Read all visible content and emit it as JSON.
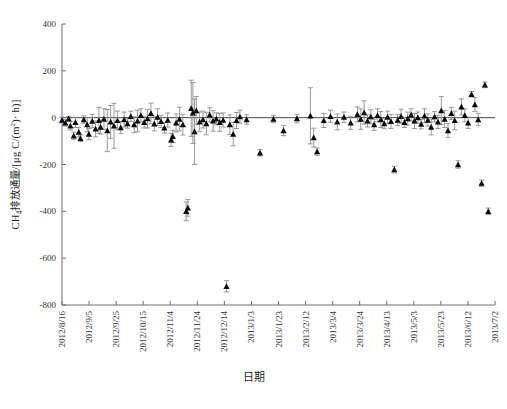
{
  "figure": {
    "background": "#ffffff",
    "marker_color": "#0b0b0b",
    "errorbar_color": "#8d8d8d",
    "axis_color": "#6f6f6f"
  },
  "axis_titles": {
    "x": "日期",
    "y_prefix": "CH",
    "y_sub": "4",
    "y_suffix": "排放通量/[μg C/(m",
    "y_sup": "2",
    "y_tail": "· h)]"
  },
  "chart_data": {
    "type": "scatter",
    "title": "",
    "subtitle": "",
    "xlabel": "日期",
    "ylabel": "CH4排放通量/[μg C/(m2 · h)]",
    "grid": false,
    "legend": null,
    "ylim": [
      -800,
      400
    ],
    "yticks": [
      400,
      200,
      0,
      -200,
      -400,
      -600,
      -800
    ],
    "ytick_labels": [
      "400",
      "200",
      "0",
      "-200",
      "-400",
      "-600",
      "-800"
    ],
    "xlim": [
      "2012/8/16",
      "2013/7/12"
    ],
    "xtick_labels": [
      "2012/8/16",
      "2012/9/5",
      "2012/9/25",
      "2012/10/15",
      "2012/11/4",
      "2012/11/24",
      "2012/12/14",
      "2013/1/3",
      "2013/1/23",
      "2013/2/12",
      "2013/3/4",
      "2013/3/24",
      "2013/4/13",
      "2013/5/3",
      "2013/5/23",
      "2013/6/12",
      "2013/7/2"
    ],
    "xtick_rotation": -90,
    "marker_shape": "triangle-up",
    "has_error_bars": true,
    "reference_line_y": 0,
    "series": [
      {
        "name": "CH4 flux",
        "points": [
          {
            "x": 0,
            "y": -10,
            "err": 12
          },
          {
            "x": 2,
            "y": -22,
            "err": 14
          },
          {
            "x": 4,
            "y": -5,
            "err": 10
          },
          {
            "x": 5,
            "y": -35,
            "err": 18
          },
          {
            "x": 7,
            "y": -78,
            "err": 16
          },
          {
            "x": 8,
            "y": -20,
            "err": 22
          },
          {
            "x": 10,
            "y": -62,
            "err": 20
          },
          {
            "x": 11,
            "y": -88,
            "err": 14
          },
          {
            "x": 13,
            "y": -8,
            "err": 16
          },
          {
            "x": 15,
            "y": -30,
            "err": 30
          },
          {
            "x": 16,
            "y": -70,
            "err": 24
          },
          {
            "x": 18,
            "y": -15,
            "err": 28
          },
          {
            "x": 20,
            "y": -48,
            "err": 34
          },
          {
            "x": 22,
            "y": -12,
            "err": 56
          },
          {
            "x": 23,
            "y": -40,
            "err": 30
          },
          {
            "x": 25,
            "y": -6,
            "err": 44
          },
          {
            "x": 27,
            "y": -55,
            "err": 90
          },
          {
            "x": 29,
            "y": -18,
            "err": 70
          },
          {
            "x": 31,
            "y": -35,
            "err": 96
          },
          {
            "x": 33,
            "y": -12,
            "err": 40
          },
          {
            "x": 35,
            "y": -42,
            "err": 26
          },
          {
            "x": 37,
            "y": -8,
            "err": 32
          },
          {
            "x": 39,
            "y": -25,
            "err": 20
          },
          {
            "x": 41,
            "y": 6,
            "err": 22
          },
          {
            "x": 43,
            "y": -30,
            "err": 34
          },
          {
            "x": 45,
            "y": -14,
            "err": 46
          },
          {
            "x": 47,
            "y": 10,
            "err": 28
          },
          {
            "x": 49,
            "y": -20,
            "err": 24
          },
          {
            "x": 51,
            "y": -4,
            "err": 40
          },
          {
            "x": 53,
            "y": 18,
            "err": 44
          },
          {
            "x": 55,
            "y": -26,
            "err": 30
          },
          {
            "x": 57,
            "y": 2,
            "err": 36
          },
          {
            "x": 59,
            "y": -16,
            "err": 26
          },
          {
            "x": 61,
            "y": -44,
            "err": 22
          },
          {
            "x": 63,
            "y": -10,
            "err": 30
          },
          {
            "x": 65,
            "y": -95,
            "err": 28
          },
          {
            "x": 66,
            "y": -80,
            "err": 26
          },
          {
            "x": 68,
            "y": -22,
            "err": 38
          },
          {
            "x": 70,
            "y": -6,
            "err": 50
          },
          {
            "x": 72,
            "y": -30,
            "err": 44
          },
          {
            "x": 74,
            "y": -400,
            "err": 40
          },
          {
            "x": 75,
            "y": -385,
            "err": 36
          },
          {
            "x": 77,
            "y": 40,
            "err": 120
          },
          {
            "x": 78,
            "y": 20,
            "err": 130
          },
          {
            "x": 79,
            "y": -60,
            "err": 140
          },
          {
            "x": 80,
            "y": 30,
            "err": 60
          },
          {
            "x": 82,
            "y": -18,
            "err": 42
          },
          {
            "x": 84,
            "y": -8,
            "err": 36
          },
          {
            "x": 86,
            "y": -25,
            "err": 48
          },
          {
            "x": 88,
            "y": 12,
            "err": 30
          },
          {
            "x": 90,
            "y": -14,
            "err": 44
          },
          {
            "x": 92,
            "y": -5,
            "err": 26
          },
          {
            "x": 94,
            "y": -20,
            "err": 38
          },
          {
            "x": 96,
            "y": -10,
            "err": 30
          },
          {
            "x": 98,
            "y": -720,
            "err": 24
          },
          {
            "x": 100,
            "y": -30,
            "err": 42
          },
          {
            "x": 102,
            "y": -70,
            "err": 50
          },
          {
            "x": 104,
            "y": -12,
            "err": 34
          },
          {
            "x": 106,
            "y": 4,
            "err": 28
          },
          {
            "x": 110,
            "y": -8,
            "err": 20
          },
          {
            "x": 118,
            "y": -150,
            "err": 14
          },
          {
            "x": 126,
            "y": -6,
            "err": 16
          },
          {
            "x": 132,
            "y": -55,
            "err": 22
          },
          {
            "x": 140,
            "y": -4,
            "err": 18
          },
          {
            "x": 148,
            "y": 8,
            "err": 120
          },
          {
            "x": 150,
            "y": -85,
            "err": 40
          },
          {
            "x": 152,
            "y": -145,
            "err": 16
          },
          {
            "x": 156,
            "y": -12,
            "err": 30
          },
          {
            "x": 160,
            "y": 6,
            "err": 26
          },
          {
            "x": 164,
            "y": -18,
            "err": 34
          },
          {
            "x": 168,
            "y": 2,
            "err": 22
          },
          {
            "x": 172,
            "y": -22,
            "err": 28
          },
          {
            "x": 176,
            "y": 14,
            "err": 32
          },
          {
            "x": 178,
            "y": -6,
            "err": 44
          },
          {
            "x": 180,
            "y": 22,
            "err": 50
          },
          {
            "x": 182,
            "y": -14,
            "err": 26
          },
          {
            "x": 184,
            "y": 4,
            "err": 30
          },
          {
            "x": 186,
            "y": -30,
            "err": 24
          },
          {
            "x": 188,
            "y": 10,
            "err": 28
          },
          {
            "x": 190,
            "y": -8,
            "err": 34
          },
          {
            "x": 192,
            "y": -25,
            "err": 22
          },
          {
            "x": 194,
            "y": 2,
            "err": 26
          },
          {
            "x": 196,
            "y": -16,
            "err": 30
          },
          {
            "x": 198,
            "y": -222,
            "err": 14
          },
          {
            "x": 200,
            "y": -10,
            "err": 24
          },
          {
            "x": 202,
            "y": 6,
            "err": 30
          },
          {
            "x": 204,
            "y": -20,
            "err": 22
          },
          {
            "x": 206,
            "y": -4,
            "err": 28
          },
          {
            "x": 208,
            "y": 12,
            "err": 26
          },
          {
            "x": 210,
            "y": -14,
            "err": 32
          },
          {
            "x": 212,
            "y": 0,
            "err": 24
          },
          {
            "x": 214,
            "y": -28,
            "err": 20
          },
          {
            "x": 216,
            "y": 8,
            "err": 30
          },
          {
            "x": 218,
            "y": -10,
            "err": 26
          },
          {
            "x": 220,
            "y": -40,
            "err": 34
          },
          {
            "x": 222,
            "y": 4,
            "err": 22
          },
          {
            "x": 224,
            "y": -18,
            "err": 28
          },
          {
            "x": 226,
            "y": 30,
            "err": 60
          },
          {
            "x": 228,
            "y": -6,
            "err": 36
          },
          {
            "x": 230,
            "y": -55,
            "err": 30
          },
          {
            "x": 232,
            "y": 18,
            "err": 26
          },
          {
            "x": 234,
            "y": -12,
            "err": 40
          },
          {
            "x": 236,
            "y": -200,
            "err": 16
          },
          {
            "x": 238,
            "y": 46,
            "err": 34
          },
          {
            "x": 240,
            "y": 10,
            "err": 28
          },
          {
            "x": 242,
            "y": -22,
            "err": 24
          },
          {
            "x": 244,
            "y": 100,
            "err": 12
          },
          {
            "x": 246,
            "y": 56,
            "err": 30
          },
          {
            "x": 248,
            "y": -8,
            "err": 26
          },
          {
            "x": 250,
            "y": -280,
            "err": 14
          },
          {
            "x": 252,
            "y": 140,
            "err": 12
          },
          {
            "x": 254,
            "y": -400,
            "err": 14
          }
        ]
      }
    ]
  }
}
